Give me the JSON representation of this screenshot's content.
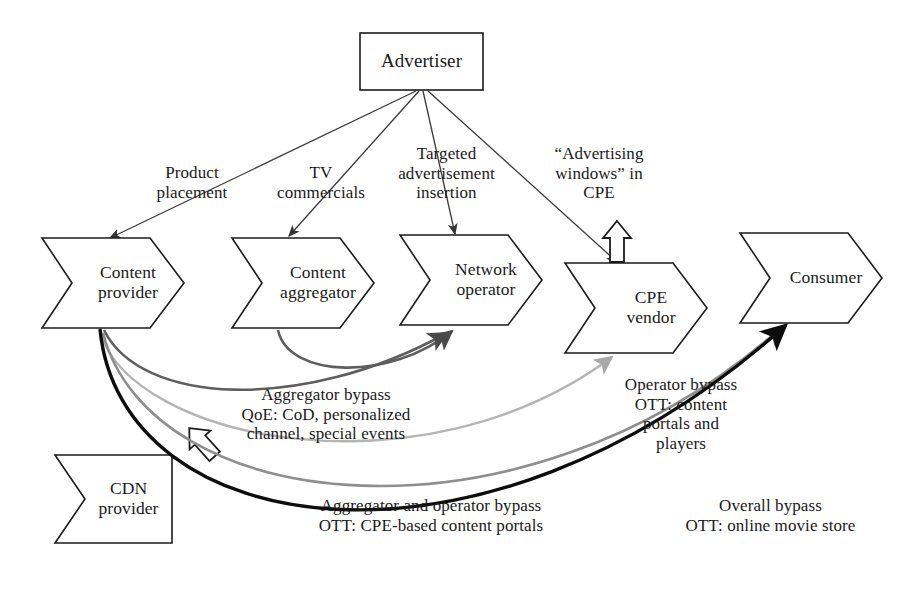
{
  "diagram": {
    "nodes": {
      "advertiser": "Advertiser",
      "content_provider": "Content\nprovider",
      "content_aggregator": "Content\naggregator",
      "network_operator": "Network\noperator",
      "cpe_vendor": "CPE\nvendor",
      "consumer": "Consumer",
      "cdn_provider": "CDN\nprovider"
    },
    "edge_labels": {
      "product_placement": "Product\nplacement",
      "tv_commercials": "TV\ncommercials",
      "targeted_ad_insertion": "Targeted\nadvertisement\ninsertion",
      "advertising_windows": "“Advertising\nwindows” in\nCPE",
      "aggregator_bypass": "Aggregator bypass\nQoE: CoD, personalized\nchannel, special events",
      "operator_bypass": "Operator bypass\nOTT: content\nportals and\nplayers",
      "aggregator_and_operator_bypass": "Aggregator and operator bypass\nOTT: CPE-based content portals",
      "overall_bypass": "Overall bypass\nOTT: online movie store"
    },
    "colors": {
      "ink": "#1b1b1b",
      "curve_dark": "#5e5e5e",
      "curve_mid": "#8e8e8e",
      "curve_light": "#b4b4b4",
      "curve_black": "#0d0d0d",
      "background": "#ffffff"
    }
  }
}
